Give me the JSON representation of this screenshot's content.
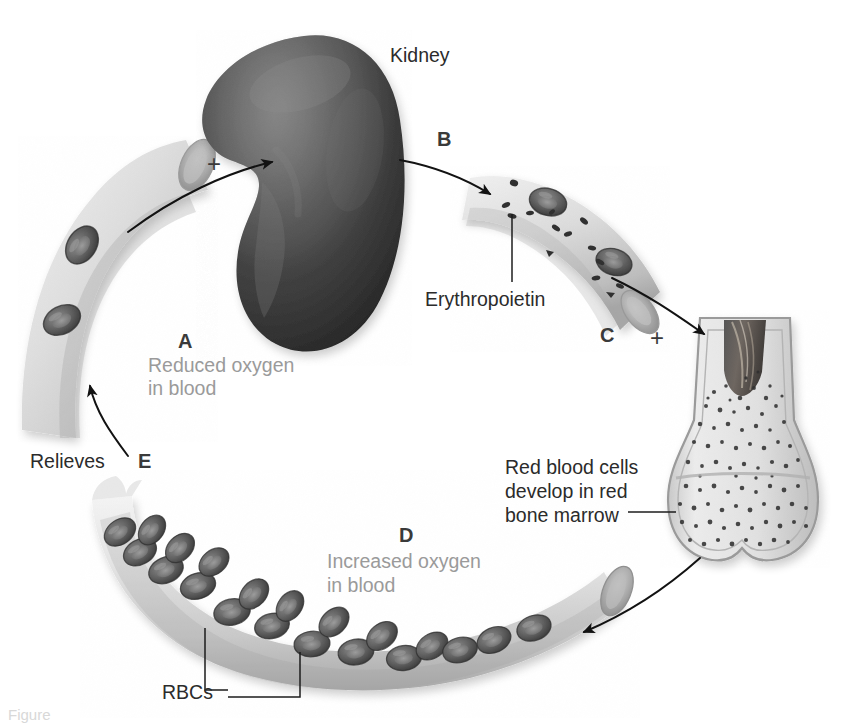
{
  "figure": {
    "caption_fragment": "Figure",
    "colors": {
      "background": "#ffffff",
      "kidney_dark": "#3a3a3a",
      "vessel_light": "#d9d9d9",
      "rbc_dark": "#4a4a4a",
      "bone_light": "#e2e2e2",
      "label_gray": "#9a9a9a",
      "label_dark": "#3c3c3c",
      "arrow": "#1a1a1a"
    }
  },
  "labels": {
    "kidney": "Kidney",
    "erythropoietin": "Erythropoietin",
    "relieves": "Relieves",
    "rbcs": "RBCs",
    "bone_marrow_line1": "Red blood cells",
    "bone_marrow_line2": "develop in red",
    "bone_marrow_line3": "bone marrow",
    "reduced_line1": "Reduced oxygen",
    "reduced_line2": "in blood",
    "increased_line1": "Increased oxygen",
    "increased_line2": "in blood"
  },
  "steps": [
    {
      "key": "A",
      "label": "A",
      "text": "Reduced oxygen in blood"
    },
    {
      "key": "B",
      "label": "B",
      "text": "Erythropoietin released"
    },
    {
      "key": "C",
      "label": "C",
      "text": "Erythropoietin travels to bone marrow"
    },
    {
      "key": "D",
      "label": "D",
      "text": "Increased oxygen in blood"
    },
    {
      "key": "E",
      "label": "E",
      "text": "Relieves reduced oxygen"
    }
  ],
  "plus_signs": [
    {
      "key": "plus-kidney",
      "symbol": "+"
    },
    {
      "key": "plus-marrow",
      "symbol": "+"
    }
  ],
  "structures": [
    {
      "key": "kidney",
      "name": "Kidney"
    },
    {
      "key": "vessel-deoxygenated",
      "name": "Blood vessel with reduced oxygen"
    },
    {
      "key": "vessel-erythropoietin",
      "name": "Blood vessel carrying erythropoietin"
    },
    {
      "key": "long-bone",
      "name": "Long bone with red bone marrow"
    },
    {
      "key": "vessel-oxygenated",
      "name": "Blood vessel with increased oxygen"
    }
  ]
}
